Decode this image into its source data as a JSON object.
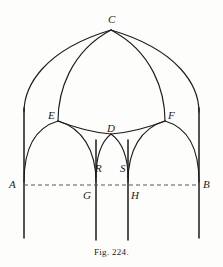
{
  "figure": {
    "caption": "Fig. 224.",
    "title": "Fig. 224.",
    "background_color": "#fdfdfc",
    "ink_color": "#1b1b1b",
    "dashed_line_color": "#55555a"
  },
  "labels": [
    {
      "id": "C",
      "text": "C",
      "x": 108,
      "y": 14,
      "note": "apex of outer pointed arch"
    },
    {
      "id": "E",
      "text": "E",
      "x": 48,
      "y": 110,
      "note": "left capital / springing node"
    },
    {
      "id": "F",
      "text": "F",
      "x": 168,
      "y": 110,
      "note": "right capital / springing node"
    },
    {
      "id": "D",
      "text": "D",
      "x": 107,
      "y": 123,
      "note": "apex of central small arch"
    },
    {
      "id": "R",
      "text": "R",
      "x": 95,
      "y": 163,
      "note": "left springing of small arch"
    },
    {
      "id": "S",
      "text": "S",
      "x": 120,
      "y": 163,
      "note": "right springing of small arch"
    },
    {
      "id": "A",
      "text": "A",
      "x": 9,
      "y": 179,
      "note": "left end of base line"
    },
    {
      "id": "B",
      "text": "B",
      "x": 203,
      "y": 179,
      "note": "right end of base line"
    },
    {
      "id": "G",
      "text": "G",
      "x": 83,
      "y": 190,
      "note": "base line at second mullion"
    },
    {
      "id": "H",
      "text": "H",
      "x": 131,
      "y": 190,
      "note": "base line at third mullion"
    }
  ],
  "geometry": {
    "points": {
      "C": {
        "x": 111,
        "y": 30
      },
      "E": {
        "x": 58,
        "y": 121
      },
      "F": {
        "x": 165,
        "y": 121
      },
      "D": {
        "x": 111,
        "y": 134
      },
      "R": {
        "x": 96,
        "y": 172
      },
      "S": {
        "x": 128,
        "y": 172
      },
      "A": {
        "x": 24,
        "y": 185
      },
      "B": {
        "x": 199,
        "y": 185
      },
      "G": {
        "x": 96,
        "y": 185
      },
      "H": {
        "x": 128,
        "y": 185
      }
    },
    "mullions": [
      {
        "name": "mullion-A",
        "x": 24,
        "top": 96,
        "bottom": 238
      },
      {
        "name": "mullion-G",
        "x": 96,
        "top": 140,
        "bottom": 240
      },
      {
        "name": "mullion-H",
        "x": 128,
        "top": 140,
        "bottom": 240
      },
      {
        "name": "mullion-B",
        "x": 199,
        "top": 96,
        "bottom": 238
      }
    ],
    "base_line": {
      "x1": 24,
      "x2": 199,
      "y": 185,
      "style": "dashed"
    }
  },
  "paths": {
    "outer_arch_left": "M 24 110 Q 40 56 111 30",
    "outer_arch_right": "M 199 110 Q 183 56 111 30",
    "inner_arch_left": "M 58 121 Q 70 62 111 30",
    "inner_arch_right": "M 165 121 Q 153 62 111 30",
    "lancet_left_outer": "M 24 112 Q 30 132 58 121",
    "lancet_left_inner": "M 96 150 Q 92 136 58 121",
    "lancet_left_arch": "M 24 180 C 24 146 38 126 58 121",
    "lancet_left_arch2": "M 96 178 C 96 146 80 126 58 121",
    "lancet_right_arch": "M 199 180 C 199 146 185 126 165 121",
    "lancet_right_arch2": "M 128 178 C 128 146 144 126 165 121",
    "cusp_left": "M 58 121 Q 92 130 111 134",
    "cusp_right": "M 165 121 Q 131 130 111 134",
    "small_arch_left": "M 96 176 C 96 156 103 142 111 134",
    "small_arch_right": "M 128 176 C 128 156 120 142 111 134"
  }
}
